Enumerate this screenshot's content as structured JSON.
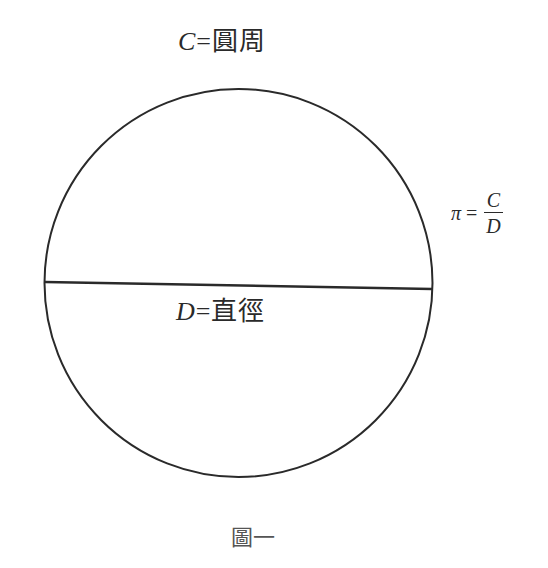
{
  "figure": {
    "circumference_label": {
      "symbol": "C",
      "equals": "=",
      "text": "圓周"
    },
    "diameter_label": {
      "symbol": "D",
      "equals": "=",
      "text": "直徑"
    },
    "pi_formula": {
      "symbol": "π",
      "equals": "=",
      "numerator": "C",
      "denominator": "D"
    },
    "caption": "圖一",
    "colors": {
      "stroke": "#2a2a2a",
      "background": "#ffffff"
    }
  }
}
